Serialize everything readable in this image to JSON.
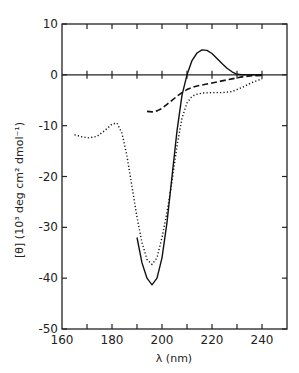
{
  "chart_data": {
    "type": "line",
    "title": "",
    "xlabel": "λ (nm)",
    "ylabel": "[θ] (10³ deg cm² dmol⁻¹)",
    "xlim": [
      160,
      250
    ],
    "ylim": [
      -50,
      10
    ],
    "xticks": [
      160,
      180,
      200,
      220,
      240
    ],
    "xtick_labels": [
      "160",
      "180",
      "200",
      "220",
      "240"
    ],
    "yticks": [
      10,
      0,
      -10,
      -20,
      -30,
      -40,
      -50
    ],
    "ytick_labels": [
      "10",
      "0",
      "-10",
      "-20",
      "-30",
      "-40",
      "-50"
    ],
    "grid": false,
    "legend": null,
    "series": [
      {
        "name": "solid",
        "style": "solid",
        "x": [
          190,
          192,
          194,
          196,
          198,
          200,
          202,
          204,
          206,
          208,
          210,
          212,
          214,
          216,
          218,
          220,
          222,
          224,
          226,
          228,
          230,
          232,
          234,
          236,
          238,
          240
        ],
        "y": [
          -32,
          -37,
          -40,
          -41.3,
          -40,
          -36,
          -29,
          -20,
          -11,
          -4,
          0,
          2.8,
          4.3,
          4.9,
          4.8,
          4.2,
          3.2,
          2.2,
          1.3,
          0.6,
          0.1,
          0,
          0,
          0,
          0,
          0
        ]
      },
      {
        "name": "dotted",
        "style": "dotted",
        "x": [
          165,
          168,
          171,
          174,
          177,
          180,
          182,
          184,
          186,
          188,
          190,
          192,
          194,
          196,
          198,
          200,
          202,
          204,
          206,
          208,
          210,
          212,
          214,
          216,
          220,
          224,
          228,
          232,
          236,
          240
        ],
        "y": [
          -11.8,
          -12.2,
          -12.4,
          -12.1,
          -11.0,
          -9.7,
          -9.5,
          -11.5,
          -16,
          -22,
          -28,
          -33,
          -36.3,
          -37.3,
          -36,
          -32,
          -27,
          -21,
          -14,
          -8.5,
          -5.5,
          -4.2,
          -3.8,
          -3.6,
          -3.5,
          -3.5,
          -3.3,
          -2.5,
          -1.5,
          -0.8
        ]
      },
      {
        "name": "dashed",
        "style": "dashed",
        "x": [
          194,
          196,
          198,
          200,
          202,
          204,
          206,
          208,
          210,
          212,
          214,
          216,
          220,
          224,
          228,
          232,
          236,
          240
        ],
        "y": [
          -7.2,
          -7.3,
          -7.1,
          -6.6,
          -5.8,
          -5.0,
          -4.2,
          -3.5,
          -2.9,
          -2.5,
          -2.2,
          -2.0,
          -1.6,
          -1.2,
          -0.8,
          -0.4,
          -0.2,
          -0.1
        ]
      }
    ]
  }
}
